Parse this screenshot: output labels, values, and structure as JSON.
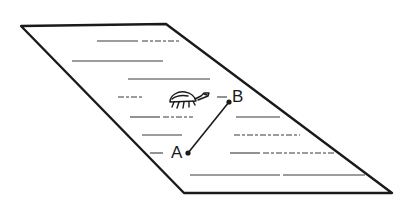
{
  "diagram": {
    "colors": {
      "ink": "#1a1a1a",
      "background": "#ffffff",
      "rule": "#3a3a3a"
    },
    "sheet": {
      "corners": {
        "top_left": [
          21,
          26
        ],
        "top_right": [
          166,
          24
        ],
        "bottom_right": [
          392,
          193
        ],
        "bottom_left": [
          184,
          193
        ]
      }
    },
    "points": [
      {
        "id": "A",
        "label": "A",
        "x": 188,
        "y": 153,
        "label_x": 171,
        "label_y": 144
      },
      {
        "id": "B",
        "label": "B",
        "x": 229,
        "y": 102,
        "label_x": 232,
        "label_y": 88
      }
    ],
    "segment": {
      "from": "A",
      "to": "B"
    },
    "insect": {
      "x": 168,
      "y": 90,
      "icon": "insect-icon"
    },
    "text_lines": [
      {
        "x1": 97,
        "x2": 138,
        "y": 41
      },
      {
        "x1": 142,
        "x2": 180,
        "y": 41
      },
      {
        "x1": 72,
        "x2": 163,
        "y": 61
      },
      {
        "x1": 128,
        "x2": 210,
        "y": 79
      },
      {
        "x1": 118,
        "x2": 143,
        "y": 97
      },
      {
        "x1": 217,
        "x2": 227,
        "y": 97
      },
      {
        "x1": 130,
        "x2": 160,
        "y": 117
      },
      {
        "x1": 163,
        "x2": 193,
        "y": 117
      },
      {
        "x1": 236,
        "x2": 280,
        "y": 117
      },
      {
        "x1": 142,
        "x2": 182,
        "y": 135
      },
      {
        "x1": 234,
        "x2": 300,
        "y": 135
      },
      {
        "x1": 150,
        "x2": 163,
        "y": 153
      },
      {
        "x1": 230,
        "x2": 260,
        "y": 153
      },
      {
        "x1": 263,
        "x2": 335,
        "y": 153
      },
      {
        "x1": 190,
        "x2": 280,
        "y": 175
      },
      {
        "x1": 283,
        "x2": 365,
        "y": 175
      }
    ]
  }
}
